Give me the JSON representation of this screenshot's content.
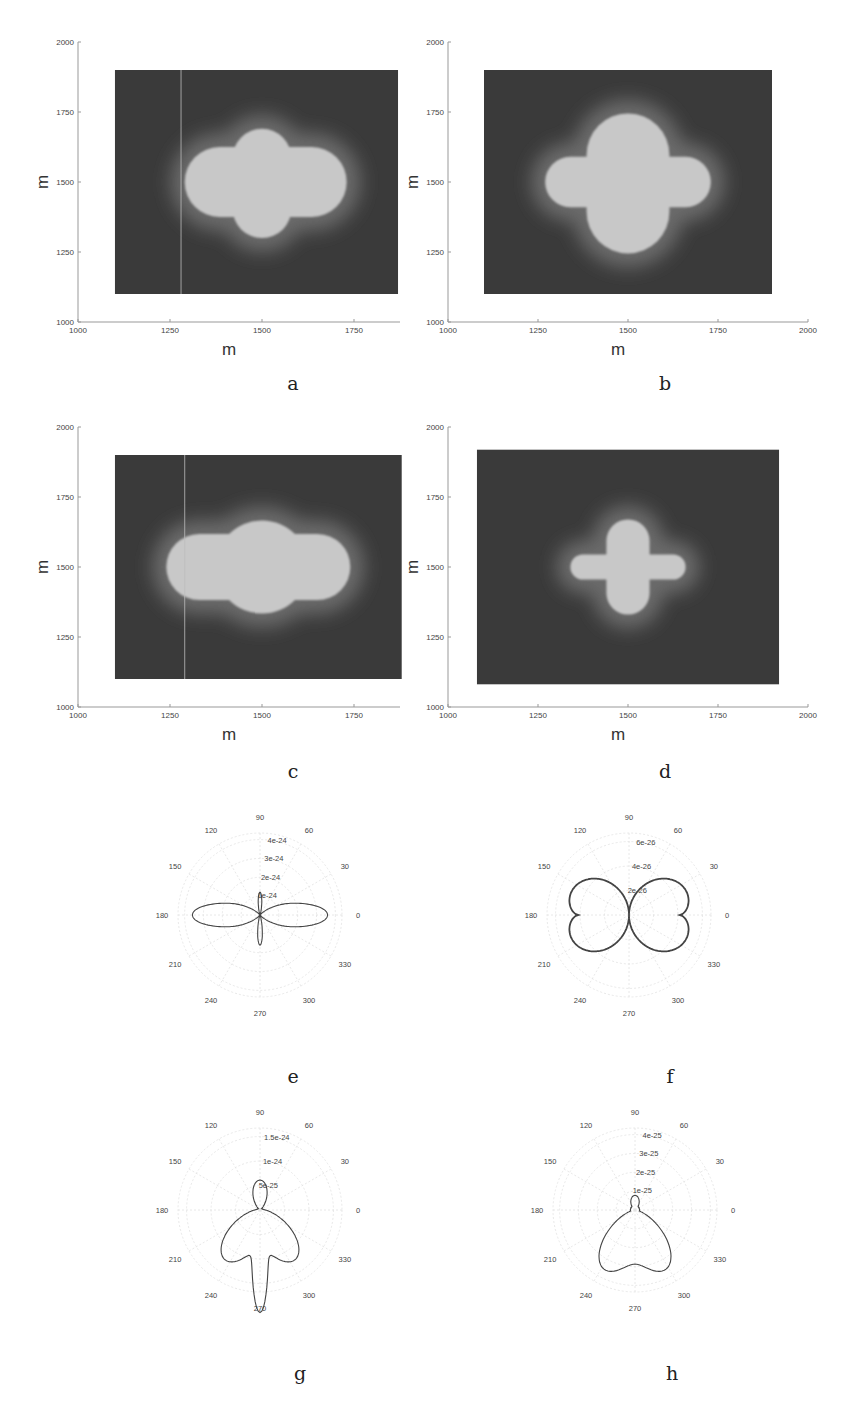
{
  "chart_data": [
    {
      "id": "a",
      "type": "heatmap",
      "caption": "a",
      "xlabel": "m",
      "ylabel": "m",
      "xlim": [
        1000,
        1875
      ],
      "ylim": [
        1000,
        2000
      ],
      "xticks": [
        "1000",
        "1250",
        "1500",
        "1750"
      ],
      "yticks": [
        "1000",
        "1250",
        "1500",
        "1750",
        "2000"
      ],
      "field_extent": {
        "x": [
          1100,
          1870
        ],
        "y": [
          1100,
          1900
        ]
      },
      "shape": "four-lobed cross, horizontal lobes wider",
      "center": [
        1500,
        1500
      ],
      "lobe_extent": {
        "left": 1290,
        "right": 1730,
        "top": 1690,
        "bottom": 1300
      },
      "arm_halfwidth": {
        "horizontal": 95,
        "vertical": 80
      },
      "artifact_line_x": 1280
    },
    {
      "id": "b",
      "type": "heatmap",
      "caption": "b",
      "xlabel": "m",
      "ylabel": "m",
      "xlim": [
        1000,
        2000
      ],
      "ylim": [
        1000,
        2000
      ],
      "xticks": [
        "1000",
        "1250",
        "1500",
        "1750",
        "2000"
      ],
      "yticks": [
        "1000",
        "1250",
        "1500",
        "1750",
        "2000"
      ],
      "field_extent": {
        "x": [
          1100,
          1900
        ],
        "y": [
          1100,
          1900
        ]
      },
      "shape": "four-lobed cross, broad lobes",
      "center": [
        1500,
        1500
      ],
      "lobe_extent": {
        "left": 1270,
        "right": 1730,
        "top": 1745,
        "bottom": 1245
      },
      "arm_halfwidth": {
        "horizontal": 70,
        "vertical": 115
      }
    },
    {
      "id": "c",
      "type": "heatmap",
      "caption": "c",
      "xlabel": "m",
      "ylabel": "m",
      "xlim": [
        1000,
        1875
      ],
      "ylim": [
        1000,
        2000
      ],
      "xticks": [
        "1000",
        "1250",
        "1500",
        "1750"
      ],
      "yticks": [
        "1000",
        "1250",
        "1500",
        "1750",
        "2000"
      ],
      "field_extent": {
        "x": [
          1100,
          1880
        ],
        "y": [
          1100,
          1900
        ]
      },
      "shape": "horizontally elongated four-lobed blob",
      "center": [
        1500,
        1500
      ],
      "lobe_extent": {
        "left": 1240,
        "right": 1740,
        "top": 1655,
        "bottom": 1345
      },
      "arm_halfwidth": {
        "horizontal": 90,
        "vertical": 110
      },
      "artifact_line_x": 1290
    },
    {
      "id": "d",
      "type": "heatmap",
      "caption": "d",
      "xlabel": "m",
      "ylabel": "m",
      "xlim": [
        1000,
        2000
      ],
      "ylim": [
        1000,
        2000
      ],
      "xticks": [
        "1000",
        "1250",
        "1500",
        "1750",
        "2000"
      ],
      "yticks": [
        "1000",
        "1250",
        "1500",
        "1750",
        "2000"
      ],
      "field_extent": {
        "x": [
          1080,
          1920
        ],
        "y": [
          1080,
          1920
        ]
      },
      "shape": "narrow cross, vertical arms longer",
      "center": [
        1500,
        1500
      ],
      "lobe_extent": {
        "left": 1340,
        "right": 1660,
        "top": 1670,
        "bottom": 1330
      },
      "arm_halfwidth": {
        "horizontal": 35,
        "vertical": 60
      }
    },
    {
      "id": "e",
      "type": "polar",
      "caption": "e",
      "angle_ticks": [
        "0",
        "30",
        "60",
        "90",
        "120",
        "150",
        "180",
        "210",
        "240",
        "270",
        "300",
        "330"
      ],
      "radial_ticks": [
        "1e-24",
        "2e-24",
        "3e-24",
        "4e-24"
      ],
      "rmax": 4.5e-24,
      "pattern": "horizontal dipole lobes with smaller vertical lobes",
      "lobes": [
        {
          "angle_deg": 0,
          "r": 3.5e-24,
          "width_deg": 14
        },
        {
          "angle_deg": 180,
          "r": 3.5e-24,
          "width_deg": 14
        },
        {
          "angle_deg": 90,
          "r": 1.2e-24,
          "width_deg": 10
        },
        {
          "angle_deg": 270,
          "r": 1.6e-24,
          "width_deg": 10
        }
      ]
    },
    {
      "id": "f",
      "type": "polar",
      "caption": "f",
      "angle_ticks": [
        "0",
        "30",
        "60",
        "90",
        "120",
        "150",
        "180",
        "210",
        "240",
        "270",
        "300",
        "330"
      ],
      "radial_ticks": [
        "2e-26",
        "4e-26",
        "6e-26"
      ],
      "rmax": 7e-26,
      "pattern": "butterfly, four thick lobes at 30/150/210/330 deg",
      "lobes": [
        {
          "angle_deg": 30,
          "r": 6.1e-26
        },
        {
          "angle_deg": 150,
          "r": 6.1e-26
        },
        {
          "angle_deg": 210,
          "r": 6.1e-26
        },
        {
          "angle_deg": 330,
          "r": 6.1e-26
        }
      ],
      "r_at_0_deg": 4.5e-26,
      "r_at_90_deg": 0
    },
    {
      "id": "g",
      "type": "polar",
      "caption": "g",
      "angle_ticks": [
        "0",
        "30",
        "60",
        "90",
        "120",
        "150",
        "180",
        "210",
        "240",
        "270",
        "300",
        "330"
      ],
      "radial_ticks": [
        "5e-25",
        "1e-24",
        "1.5e-24"
      ],
      "rmax": 1.7e-24,
      "pattern": "downward three-lobed pattern",
      "lobes": [
        {
          "angle_deg": 235,
          "r": 1.2e-24
        },
        {
          "angle_deg": 270,
          "r": 1.3e-24
        },
        {
          "angle_deg": 305,
          "r": 1.2e-24
        }
      ]
    },
    {
      "id": "h",
      "type": "polar",
      "caption": "h",
      "angle_ticks": [
        "0",
        "30",
        "60",
        "90",
        "120",
        "150",
        "180",
        "210",
        "240",
        "270",
        "300",
        "330"
      ],
      "radial_ticks": [
        "1e-25",
        "2e-25",
        "3e-25",
        "4e-25"
      ],
      "rmax": 4.5e-25,
      "pattern": "downward two-lobed pattern",
      "lobes": [
        {
          "angle_deg": 240,
          "r": 3.5e-25
        },
        {
          "angle_deg": 300,
          "r": 3.5e-25
        }
      ]
    }
  ],
  "captions": {
    "a": "a",
    "b": "b",
    "c": "c",
    "d": "d",
    "e": "e",
    "f": "f",
    "g": "g",
    "h": "h"
  },
  "colors": {
    "field_bg": "#3a3a3a",
    "shape_fill": "#c8c8c8",
    "halo": "#6b6b6b",
    "axis": "#999999",
    "curve": "#444444",
    "grid": "#e2e2e2"
  }
}
